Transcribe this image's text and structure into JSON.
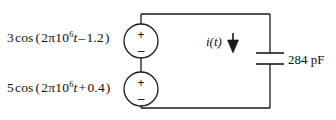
{
  "diagram": {
    "type": "circuit-schematic",
    "stroke_color": "#1a1a1a",
    "text_color": "#111111",
    "background": "#ffffff"
  },
  "sources": [
    {
      "id": "source-top",
      "symbol": "independent-voltage-source",
      "amplitude": "3",
      "function": "cos",
      "expression_parts": {
        "amplitude": "3",
        "function": "cos",
        "open_paren": "(",
        "coefficient": "2π10",
        "exponent": "6",
        "time_var": "t",
        "operator": "–",
        "phase": "1.2",
        "close_paren": ")"
      },
      "plus_label": "+",
      "minus_label": "–"
    },
    {
      "id": "source-bottom",
      "symbol": "independent-voltage-source",
      "amplitude": "5",
      "function": "cos",
      "expression_parts": {
        "amplitude": "5",
        "function": "cos",
        "open_paren": "(",
        "coefficient": "2π10",
        "exponent": "6",
        "time_var": "t",
        "operator": "+",
        "phase": "0.4",
        "close_paren": ")"
      },
      "plus_label": "+",
      "minus_label": "–"
    }
  ],
  "current": {
    "label_var": "i",
    "label": "i(t)",
    "direction": "down"
  },
  "capacitor": {
    "value": "284",
    "unit": "pF",
    "label": "284 pF"
  }
}
